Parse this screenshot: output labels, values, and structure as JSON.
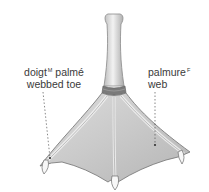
{
  "diagram": {
    "labels": [
      {
        "id": "toe",
        "fr": "doigt",
        "gender": "M",
        "fr_suffix": "palmé",
        "en": "webbed toe"
      },
      {
        "id": "web",
        "fr": "palmure",
        "gender": "F",
        "fr_suffix": "",
        "en": "web"
      }
    ],
    "colors": {
      "text": "#3a3a3a",
      "skin_light": "#ececec",
      "skin_mid": "#c8c8c8",
      "skin_dark": "#8f8f8f",
      "band": "#6f6f6f",
      "leader": "#555555"
    }
  }
}
